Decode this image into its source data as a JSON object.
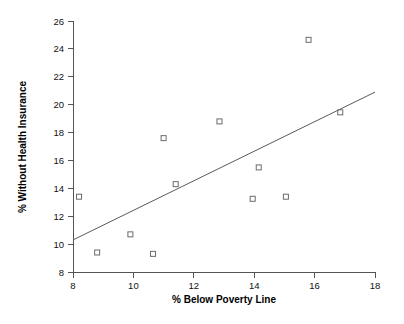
{
  "chart_data": {
    "type": "scatter",
    "title": "",
    "xlabel": "% Below Poverty Line",
    "ylabel": "% Without Health Insurance",
    "xlim": [
      8,
      18
    ],
    "ylim": [
      8,
      26
    ],
    "xticks": [
      "8",
      "10",
      "12",
      "14",
      "16",
      "18"
    ],
    "xtick_values": [
      8,
      10,
      12,
      14,
      16,
      18
    ],
    "yticks": [
      "8",
      "10",
      "12",
      "14",
      "16",
      "18",
      "20",
      "22",
      "24",
      "26"
    ],
    "ytick_values": [
      8,
      10,
      12,
      14,
      16,
      18,
      20,
      22,
      24,
      26
    ],
    "grid": false,
    "legend": false,
    "marker_shape": "open-square",
    "marker_color": "#6b6b6b",
    "points": [
      {
        "x": 8.2,
        "y": 13.4
      },
      {
        "x": 8.8,
        "y": 9.4
      },
      {
        "x": 9.9,
        "y": 10.7
      },
      {
        "x": 10.65,
        "y": 9.3
      },
      {
        "x": 11.0,
        "y": 17.6
      },
      {
        "x": 11.4,
        "y": 14.3
      },
      {
        "x": 12.85,
        "y": 18.8
      },
      {
        "x": 13.95,
        "y": 13.25
      },
      {
        "x": 14.15,
        "y": 15.5
      },
      {
        "x": 15.05,
        "y": 13.4
      },
      {
        "x": 15.8,
        "y": 24.65
      },
      {
        "x": 16.85,
        "y": 19.45
      }
    ],
    "trendline": {
      "type": "linear-fit",
      "x_start": 8.0,
      "y_start": 10.3,
      "x_end": 18.0,
      "y_end": 20.9,
      "color": "#5a5a5a"
    }
  }
}
